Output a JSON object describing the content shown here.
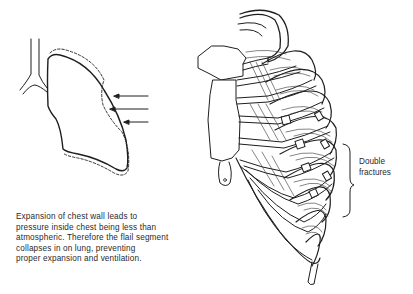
{
  "figure": {
    "type": "medical-illustration",
    "left_panel": {
      "name": "lung-diagram",
      "elements": [
        "trachea-bronchus",
        "lung-outline",
        "dashed-expansion-outline",
        "inward-arrows"
      ],
      "arrow_count": 3
    },
    "right_panel": {
      "name": "rib-cage",
      "elements": [
        "sternum",
        "xiphoid-process",
        "ribs",
        "costal-cartilages",
        "fracture-sites"
      ]
    },
    "caption": {
      "lines": [
        "Expansion of chest wall leads to",
        "pressure inside chest being less than",
        "atmospheric. Therefore the flail segment",
        "collapses in on lung, preventing",
        "proper expansion and ventilation."
      ]
    },
    "annotation": {
      "lines": [
        "Double",
        "fractures"
      ]
    },
    "colors": {
      "line": "#1e1e1e",
      "background": "#ffffff",
      "text": "#2a2a2a"
    }
  }
}
